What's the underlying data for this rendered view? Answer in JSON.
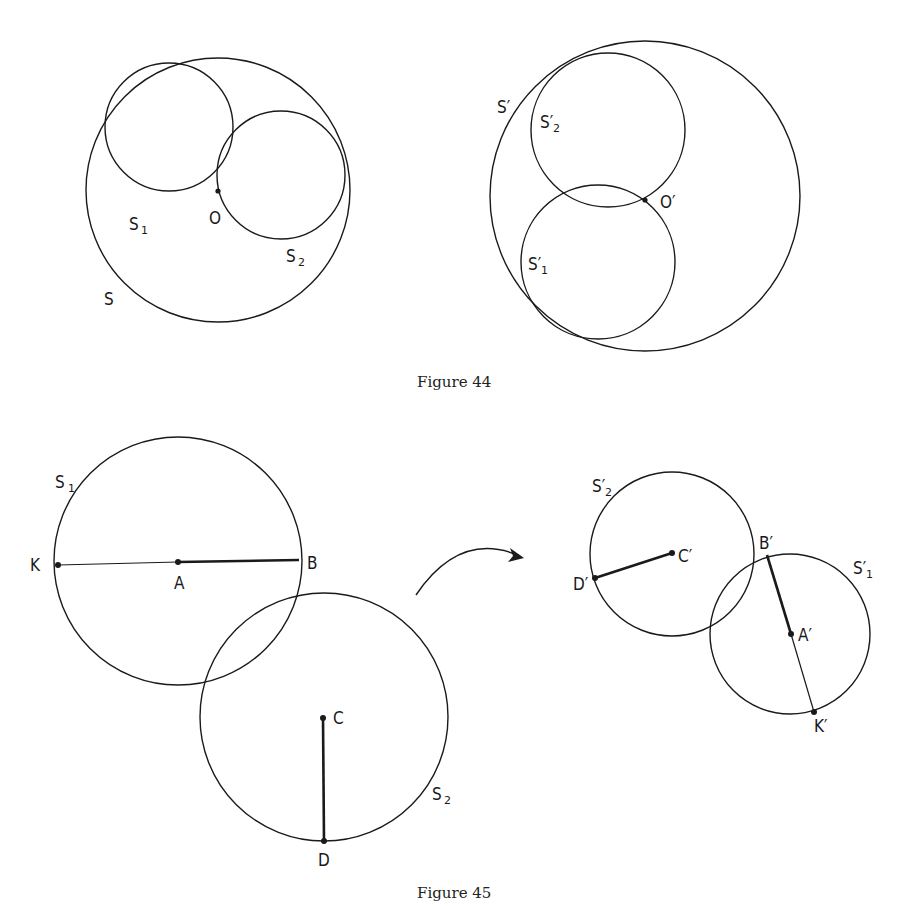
{
  "figures": {
    "fig44": {
      "caption": "Figure 44",
      "left": {
        "labels": {
          "S": "S",
          "S1": "S",
          "S1_sub": "1",
          "S2": "S",
          "S2_sub": "2",
          "O": "O"
        }
      },
      "right": {
        "labels": {
          "Sp": "S′",
          "Sp2": "S′",
          "Sp2_sub": "2",
          "Sp1": "S′",
          "Sp1_sub": "1",
          "Op": "O′"
        }
      }
    },
    "fig45": {
      "caption": "Figure 45",
      "left": {
        "labels": {
          "S1": "S",
          "S1_sub": "1",
          "S2": "S",
          "S2_sub": "2",
          "K": "K",
          "A": "A",
          "B": "B",
          "C": "C",
          "D": "D"
        }
      },
      "right": {
        "labels": {
          "Sp2": "S′",
          "Sp2_sub": "2",
          "Sp1": "S′",
          "Sp1_sub": "1",
          "Cp": "C′",
          "Dp": "D′",
          "Bp": "B′",
          "Ap": "A′",
          "Kp": "K′"
        }
      },
      "arrow": "curved-arrow-right"
    }
  },
  "colors": {
    "ink": "#1a1a1a",
    "background": "#ffffff"
  }
}
